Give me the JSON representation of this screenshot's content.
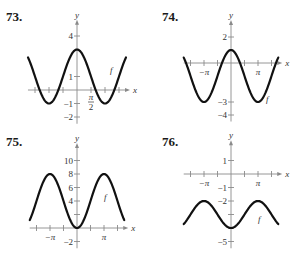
{
  "chart_data": [
    {
      "id": "73",
      "label": "73.",
      "type": "line",
      "title": "",
      "xlabel": "x",
      "ylabel": "y",
      "series": [
        {
          "name": "f",
          "expression": "1 + 2cos(x)",
          "x_range": [
            "-7π/4",
            "7π/4"
          ],
          "max": 3,
          "min": -1
        }
      ],
      "y_ticks": [
        -2,
        -1,
        1,
        4
      ],
      "y_tick_labels": [
        "−2",
        "−1",
        "1",
        "4"
      ],
      "x_ticks_spacing": "π/2",
      "x_tick_labels": [
        {
          "value": "π/2",
          "label_num": "π",
          "label_den": "2"
        }
      ],
      "origin_px": [
        77,
        90
      ],
      "x_unit_px_per_pi": 28,
      "y_unit_px": 13.5,
      "x_range": [
        -5.5,
        5.5
      ],
      "y_range": [
        -2.5,
        4.9
      ],
      "curve_label": "f",
      "curve_label_pos": [
        110,
        73
      ],
      "grid": false,
      "legend": "none"
    },
    {
      "id": "74",
      "label": "74.",
      "type": "line",
      "title": "",
      "xlabel": "x",
      "ylabel": "y",
      "series": [
        {
          "name": "f",
          "expression": "-1 + 2cos(x)",
          "x_range": [
            "-7π/4",
            "7π/4"
          ],
          "max": 1,
          "min": -3
        }
      ],
      "y_ticks": [
        -4,
        -3,
        2
      ],
      "y_tick_labels": [
        "−4",
        "−3",
        "2"
      ],
      "x_ticks_spacing": "π/2",
      "x_tick_labels": [
        {
          "value": "-π",
          "label": "−π"
        },
        {
          "value": "π",
          "label": "π"
        }
      ],
      "origin_px": [
        231,
        63
      ],
      "x_unit_px_per_pi": 27,
      "y_unit_px": 13,
      "x_range": [
        -5.5,
        5.5
      ],
      "y_range": [
        -4.5,
        3.0
      ],
      "curve_label": "f",
      "curve_label_pos": [
        266,
        102
      ],
      "grid": false,
      "legend": "none"
    },
    {
      "id": "75",
      "label": "75.",
      "type": "line",
      "title": "",
      "xlabel": "x",
      "ylabel": "y",
      "series": [
        {
          "name": "f",
          "expression": "4 - 4cos(x)",
          "x_range": [
            "-7π/4",
            "7π/4"
          ],
          "max": 8,
          "min": 0
        }
      ],
      "y_ticks": [
        -2,
        2,
        4,
        6,
        8,
        10
      ],
      "y_tick_labels": [
        "−2",
        "",
        "4",
        "6",
        "8",
        "10"
      ],
      "x_ticks_spacing": "π/2",
      "x_tick_labels": [
        {
          "value": "-π",
          "label": "−π"
        },
        {
          "value": "π",
          "label": "π"
        }
      ],
      "origin_px": [
        77,
        228
      ],
      "x_unit_px_per_pi": 27,
      "y_unit_px": 6.75,
      "x_range": [
        -5.5,
        5.5
      ],
      "y_range": [
        -3,
        12
      ],
      "curve_label": "f",
      "curve_label_pos": [
        104,
        200
      ],
      "grid": false,
      "legend": "none"
    },
    {
      "id": "76",
      "label": "76.",
      "type": "line",
      "title": "",
      "xlabel": "x",
      "ylabel": "y",
      "series": [
        {
          "name": "f",
          "expression": "-3 - cos(x)",
          "x_range": [
            "-7π/4",
            "7π/4"
          ],
          "max": -2,
          "min": -4
        }
      ],
      "y_ticks": [
        -5,
        -4,
        -3,
        -2,
        -1,
        1
      ],
      "y_tick_labels": [
        "−5",
        "",
        "",
        "−2",
        "−1",
        "1"
      ],
      "x_ticks_spacing": "π/2",
      "x_tick_labels": [
        {
          "value": "-π",
          "label": "−π"
        },
        {
          "value": "π",
          "label": "π"
        }
      ],
      "origin_px": [
        231,
        174
      ],
      "x_unit_px_per_pi": 27,
      "y_unit_px": 13.5,
      "x_range": [
        -5.5,
        5.5
      ],
      "y_range": [
        -5.5,
        2.2
      ],
      "curve_label": "f",
      "curve_label_pos": [
        258,
        222
      ],
      "grid": false,
      "legend": "none"
    }
  ],
  "problems": {
    "p73": {
      "number": "73."
    },
    "p74": {
      "number": "74."
    },
    "p75": {
      "number": "75."
    },
    "p76": {
      "number": "76."
    }
  }
}
